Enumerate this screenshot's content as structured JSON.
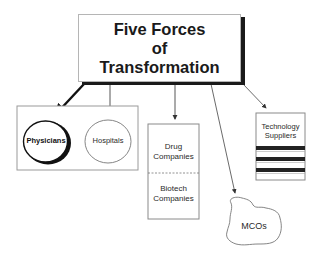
{
  "title": {
    "lines": [
      "Five Forces",
      "of",
      "Transformation"
    ]
  },
  "forces": {
    "providers": {
      "physicians": "Physicians",
      "hospitals": "Hospitals"
    },
    "pharma": {
      "drug": [
        "Drug",
        "Companies"
      ],
      "biotech": [
        "Biotech",
        "Companies"
      ]
    },
    "mcos": "MCOs",
    "technology": [
      "Technology",
      "Suppliers"
    ]
  },
  "colors": {
    "line": "#1a1a1a",
    "thin_line": "#555555",
    "box_border": "#9a9a9a"
  }
}
